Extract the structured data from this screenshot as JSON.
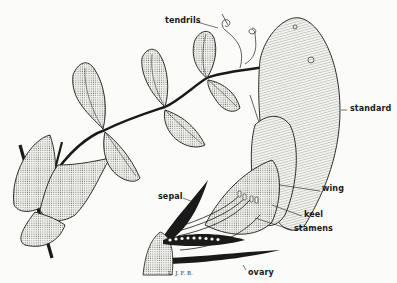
{
  "diagram": {
    "labels": {
      "tendrils": "tendrils",
      "standard": "standard",
      "wing": "wing",
      "keel": "keel",
      "stamens": "stamens",
      "sepal": "sepal",
      "ovary": "ovary"
    },
    "signature": "L. J. F. B."
  },
  "colors": {
    "ink": "#1a1a1a",
    "paper": "#fbfbf9",
    "stipple": "#9a9a95"
  }
}
